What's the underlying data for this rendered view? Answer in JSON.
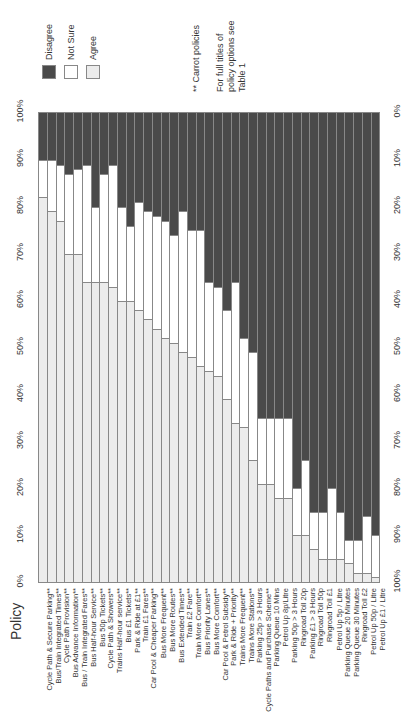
{
  "legend": {
    "items": [
      {
        "label": "Disagree",
        "color": "#4a4a4a"
      },
      {
        "label": "Not Sure",
        "color": "#ffffff"
      },
      {
        "label": "Agree",
        "color": "#ececec"
      }
    ]
  },
  "notes": {
    "carrot": "** Carrot policies",
    "full_titles_1": "For full titles of",
    "full_titles_2": "policy options see",
    "full_titles_3": "Table 1"
  },
  "axis": {
    "left_ticks": [
      "100%",
      "90%",
      "80%",
      "70%",
      "60%",
      "50%",
      "40%",
      "30%",
      "20%",
      "10%",
      "0%"
    ],
    "right_ticks": [
      "0%",
      "10%",
      "20%",
      "30%",
      "40%",
      "50%",
      "60%",
      "70%",
      "80%",
      "90%",
      "100%"
    ],
    "category_title": "Policy"
  },
  "chart_data": {
    "type": "bar",
    "stacked": true,
    "orientation": "vertical columns (figure printed rotated)",
    "title": "",
    "xlabel": "Policy",
    "ylabel": "",
    "ylim": [
      0,
      100
    ],
    "y_tick_labels": [
      "0%",
      "10%",
      "20%",
      "30%",
      "40%",
      "50%",
      "60%",
      "70%",
      "80%",
      "90%",
      "100%"
    ],
    "secondary_y_tick_labels_reversed": [
      "100%",
      "90%",
      "80%",
      "70%",
      "60%",
      "50%",
      "40%",
      "30%",
      "20%",
      "10%",
      "0%"
    ],
    "legend_position": "top-left",
    "grid": false,
    "annotations": [
      "** Carrot policies",
      "For full titles of policy options see Table 1"
    ],
    "categories": [
      "Cycle Path & Secure Parking**",
      "Bus/Train Integrated Times**",
      "Cycle Path Provision**",
      "Bus Advance Information**",
      "Bus / Train Integrated Fares**",
      "Bus Half-hour Service**",
      "Bus 50p Tickets**",
      "Cycle Path & Showers**",
      "Trains Half-hour service**",
      "Bus £1 Tickets**",
      "Park & Ride at £1**",
      "Train £1 Fares**",
      "Car Pool & Cheaper Parking**",
      "Bus More Frequent**",
      "Bus More Routes**",
      "Bus Extended Times**",
      "Train £2 Fare**",
      "Train More Comfort**",
      "Bus Priority Lanes**",
      "Bus More Comfort**",
      "Car Pool & Petrol Subsidy**",
      "Park & Ride + Priority**",
      "Trains More Frequent**",
      "Trains More Stations**",
      "Parking 25p > 3 Hours",
      "Cycle Paths and Purchase Scheme**",
      "Parking Queue 10 Mins",
      "Petrol Up 8p/Litre",
      "Parking 50p > 3 Hours",
      "Ringroad Toll 20p",
      "Parking £1 > 3 Hours",
      "Ringroad Toll 50p",
      "Ringroad Toll £1",
      "Petrol Up 5p / Litre",
      "Parking Queue 20 Minutes",
      "Parking Queue 30 Minutes",
      "Ringroad Toll £2",
      "Petrol Up 50p / Litre",
      "Petrol Up £1 / Litre"
    ],
    "series": [
      {
        "name": "Agree",
        "color": "#ececec",
        "values": [
          82,
          79,
          77,
          70,
          70,
          64,
          64,
          64,
          63,
          60,
          60,
          58,
          56,
          54,
          52,
          51,
          49,
          48,
          46,
          45,
          44,
          39,
          34,
          33,
          26,
          21,
          21,
          18,
          18,
          10,
          10,
          7,
          5,
          5,
          5,
          4,
          2,
          2,
          1
        ]
      },
      {
        "name": "Not Sure",
        "color": "#ffffff",
        "values": [
          8,
          11,
          12,
          17,
          18,
          25,
          16,
          23,
          26,
          20,
          16,
          23,
          23,
          24,
          25,
          23,
          30,
          27,
          29,
          19,
          19,
          19,
          30,
          19,
          23,
          14,
          14,
          17,
          17,
          10,
          16,
          8,
          10,
          15,
          10,
          5,
          7,
          12,
          9
        ]
      },
      {
        "name": "Disagree",
        "color": "#4a4a4a",
        "values": [
          10,
          10,
          11,
          13,
          12,
          11,
          20,
          13,
          11,
          20,
          24,
          19,
          21,
          22,
          23,
          26,
          21,
          25,
          25,
          36,
          37,
          42,
          36,
          48,
          51,
          65,
          65,
          65,
          65,
          80,
          74,
          85,
          85,
          80,
          85,
          91,
          91,
          86,
          90
        ]
      }
    ]
  }
}
